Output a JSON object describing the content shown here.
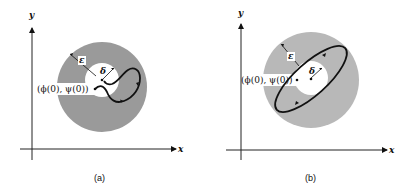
{
  "panels": [
    {
      "id": "a",
      "caption": "(a)",
      "x_axis_label": "x",
      "y_axis_label": "y",
      "epsilon_label": "ε",
      "delta_label": "δ",
      "initial_point_label": "(ϕ(0), ψ(0))",
      "trajectory": "spiral path leaving the δ-disk but staying inside the ε-disk"
    },
    {
      "id": "b",
      "caption": "(b)",
      "x_axis_label": "x",
      "y_axis_label": "y",
      "epsilon_label": "ε",
      "delta_label": "δ",
      "initial_point_label": "(ϕ(0), ψ(0))",
      "trajectory": "closed elliptical orbit passing through the δ-disk, inside the ε-disk"
    }
  ],
  "colors": {
    "annulus_fill": "#9a9a9a",
    "inner_fill": "#ffffff",
    "line": "#111111"
  }
}
